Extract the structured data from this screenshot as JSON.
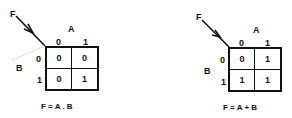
{
  "maps": [
    {
      "output_label": "F",
      "col_var": "A",
      "row_var": "B",
      "col_headers": [
        "0",
        "1"
      ],
      "row_headers": [
        "0",
        "1"
      ],
      "cells": [
        [
          "0",
          "0"
        ],
        [
          "0",
          "1"
        ]
      ],
      "equation": "F = A . B"
    },
    {
      "output_label": "F",
      "col_var": "A",
      "row_var": "B",
      "col_headers": [
        "0",
        "1"
      ],
      "row_headers": [
        "0",
        "1"
      ],
      "cells": [
        [
          "0",
          "1"
        ],
        [
          "1",
          "1"
        ]
      ],
      "equation": "F = A + B"
    }
  ]
}
